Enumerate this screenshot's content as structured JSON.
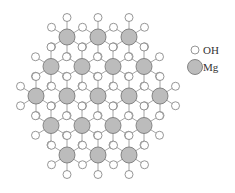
{
  "legend": {
    "items": [
      {
        "label": "OH",
        "symbol": "oh"
      },
      {
        "label": "Mg",
        "symbol": "mg"
      }
    ]
  },
  "colors": {
    "mg_fill": "#bcbcbc",
    "mg_stroke": "#7a7a7a",
    "oh_fill": "#ffffff",
    "oh_stroke": "#8a8a8a",
    "bond": "#9a9a9a"
  },
  "lattice": {
    "mg_radius": 8,
    "oh_radius": 4,
    "bond_dx": 15.5,
    "bond_dy_short": 9.75,
    "bond_dy_long": 19.5,
    "mg_rows": [
      {
        "y": 37,
        "x": [
          67,
          98,
          129
        ]
      },
      {
        "y": 66.5,
        "x": [
          51,
          82,
          113,
          144
        ]
      },
      {
        "y": 96,
        "x": [
          36,
          67,
          98,
          129,
          160
        ]
      },
      {
        "y": 125.5,
        "x": [
          51,
          82,
          113,
          144
        ]
      },
      {
        "y": 155,
        "x": [
          67,
          98,
          129
        ]
      }
    ]
  }
}
